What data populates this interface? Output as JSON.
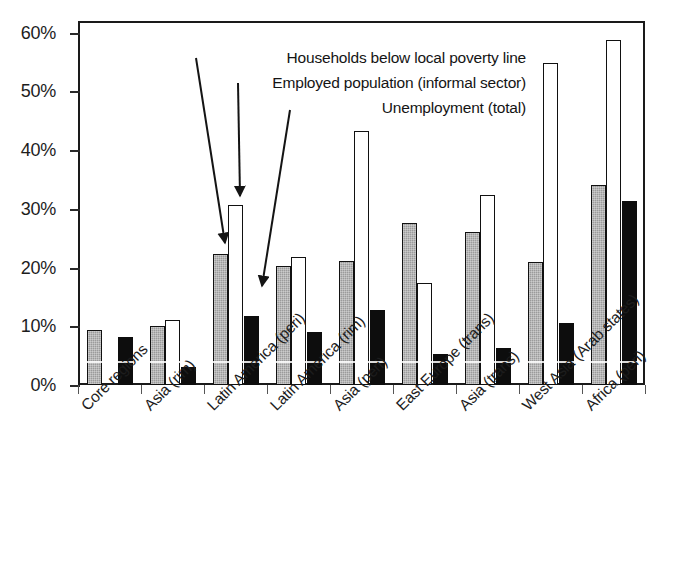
{
  "chart_data": {
    "type": "bar",
    "title": "",
    "subtitle": "",
    "xlabel": "",
    "ylabel": "",
    "ylim": [
      0,
      62
    ],
    "ytick_labels": [
      "0%",
      "10%",
      "20%",
      "30%",
      "40%",
      "50%",
      "60%"
    ],
    "ytick_values": [
      0,
      10,
      20,
      30,
      40,
      50,
      60
    ],
    "grid": false,
    "legend_position": "inside-annotations",
    "categories": [
      "Core regions",
      "Asia (rim)",
      "Latin America (peri)",
      "Latin America (rim)",
      "Asia (peri)",
      "East Europe (trans)",
      "Asia (trans)",
      "West Asia (Arab states)",
      "Africa (peri)"
    ],
    "series": [
      {
        "name": "Households below local poverty line",
        "color": "#9b9b9b",
        "values": [
          9.3,
          10.0,
          22.4,
          20.3,
          21.2,
          27.6,
          26.0,
          20.9,
          34.0
        ]
      },
      {
        "name": "Employed population (informal sector)",
        "color": "#ffffff",
        "values": [
          null,
          11.1,
          30.7,
          21.8,
          43.2,
          17.3,
          32.4,
          54.8,
          58.7
        ]
      },
      {
        "name": "Unemployment (total)",
        "color": "#0d0d0d",
        "values": [
          8.2,
          3.1,
          11.8,
          9.0,
          12.7,
          5.2,
          6.3,
          10.5,
          31.3
        ]
      }
    ],
    "annotations": [
      "Households below local poverty line",
      "Employed population (informal sector)",
      "Unemployment (total)"
    ]
  }
}
